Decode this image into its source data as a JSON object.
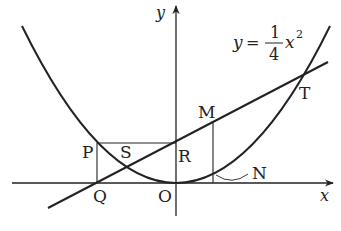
{
  "equation": {
    "lhs": "y",
    "eq": "=",
    "numerator": "1",
    "denominator": "4",
    "var": "x",
    "exponent": "2"
  },
  "axes": {
    "x_label": "x",
    "y_label": "y"
  },
  "points": {
    "P": "P",
    "Q": "Q",
    "R": "R",
    "S": "S",
    "O": "O",
    "M": "M",
    "N": "N",
    "T": "T"
  },
  "colors": {
    "stroke": "#222222",
    "background": "#ffffff"
  }
}
